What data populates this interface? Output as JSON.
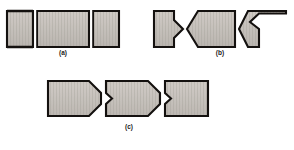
{
  "figure": {
    "width": 294,
    "height": 150,
    "background_color": "#ffffff",
    "outline_color": "#14110f",
    "metal_fill_light": "#cfcac4",
    "metal_fill_mid": "#bdb8b2",
    "metal_fill_dark": "#a7a29c",
    "striation_color": "#9b958f",
    "label_color": "#1a1a1a",
    "panels": [
      {
        "id": "a",
        "label": "(a)",
        "name": "square-butt-joint",
        "pieces": [
          {
            "name": "left-member",
            "profile": "square-end"
          },
          {
            "name": "center-member",
            "profile": "square-both-ends"
          },
          {
            "name": "right-member",
            "profile": "square-end"
          }
        ],
        "joint_count": 2
      },
      {
        "id": "b",
        "label": "(b)",
        "name": "double-vee-notched-joint",
        "pieces": [
          {
            "name": "left-member",
            "profile": "vee-notch-female"
          },
          {
            "name": "center-member",
            "profile": "vee-point-male-both-ends"
          },
          {
            "name": "right-member",
            "profile": "vee-notch-female"
          }
        ],
        "joint_count": 2
      },
      {
        "id": "c",
        "label": "(c)",
        "name": "single-vee-chamfered-joint",
        "pieces": [
          {
            "name": "left-member",
            "profile": "chamfered-point-right"
          },
          {
            "name": "center-member",
            "profile": "notch-left-point-right"
          },
          {
            "name": "right-member",
            "profile": "notch-left-square-right"
          }
        ],
        "joint_count": 2
      }
    ]
  }
}
